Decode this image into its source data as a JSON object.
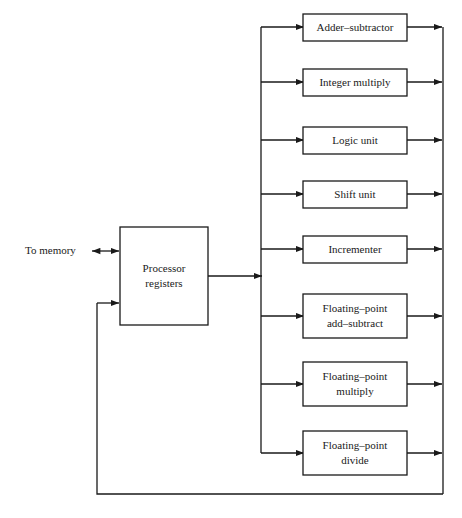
{
  "diagram": {
    "title_visible": false,
    "colors": {
      "line": "#1a1a1a",
      "box_fill": "#ffffff",
      "background": "#ffffff",
      "text": "#1a1a1a"
    },
    "memory_label": "To memory",
    "registers": {
      "line1": "Processor",
      "line2": "registers"
    },
    "units": [
      {
        "id": "adder-subtractor",
        "line1": "Adder–subtractor",
        "line2": ""
      },
      {
        "id": "integer-multiply",
        "line1": "Integer multiply",
        "line2": ""
      },
      {
        "id": "logic-unit",
        "line1": "Logic unit",
        "line2": ""
      },
      {
        "id": "shift-unit",
        "line1": "Shift unit",
        "line2": ""
      },
      {
        "id": "incrementer",
        "line1": "Incrementer",
        "line2": ""
      },
      {
        "id": "floating-point-add-subtract",
        "line1": "Floating–point",
        "line2": "add–subtract"
      },
      {
        "id": "floating-point-multiply",
        "line1": "Floating–point",
        "line2": "multiply"
      },
      {
        "id": "floating-point-divide",
        "line1": "Floating–point",
        "line2": "divide"
      }
    ]
  }
}
